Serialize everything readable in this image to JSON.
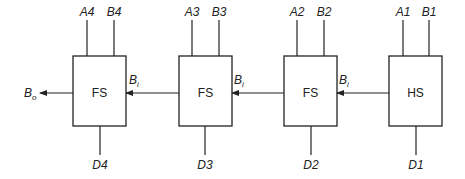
{
  "diagram": {
    "output_label": {
      "main": "B",
      "sub": "o"
    },
    "colors": {
      "stroke": "#222222",
      "background": "#ffffff"
    },
    "blocks": [
      {
        "id": "fs4",
        "label": "FS",
        "in_a": "A4",
        "in_b": "B4",
        "out_d": "D4",
        "borrow_in": {
          "main": "B",
          "sub": "i"
        }
      },
      {
        "id": "fs3",
        "label": "FS",
        "in_a": "A3",
        "in_b": "B3",
        "out_d": "D3",
        "borrow_in": {
          "main": "B",
          "sub": "i"
        }
      },
      {
        "id": "fs2",
        "label": "FS",
        "in_a": "A2",
        "in_b": "B2",
        "out_d": "D2",
        "borrow_in": {
          "main": "B",
          "sub": "i"
        }
      },
      {
        "id": "hs1",
        "label": "HS",
        "in_a": "A1",
        "in_b": "B1",
        "out_d": "D1"
      }
    ]
  }
}
